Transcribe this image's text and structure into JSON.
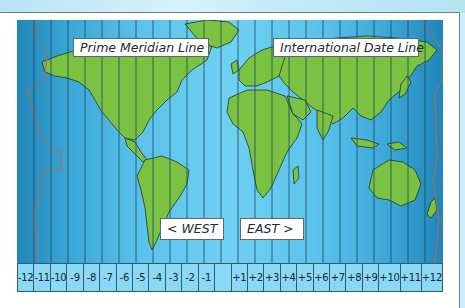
{
  "labels": {
    "prime_meridian": "Prime Meridian Line",
    "date_line": "International Date Line",
    "west": "<  WEST",
    "east": "EAST  >"
  },
  "zones": [
    "-12",
    "-11",
    "-10",
    "-9",
    "-8",
    "-7",
    "-6",
    "-5",
    "-4",
    "-3",
    "-2",
    "-1",
    "",
    "+1",
    "+2",
    "+3",
    "+4",
    "+5",
    "+6",
    "+7",
    "+8",
    "+9",
    "+10",
    "+11",
    "+12"
  ],
  "colors": {
    "ocean_light": "#6fd0f2",
    "ocean_dark": "#1f86b8",
    "land": "#7cc242",
    "zone_strip": "#8ad8f5",
    "date_line_border": "#b06a60"
  }
}
